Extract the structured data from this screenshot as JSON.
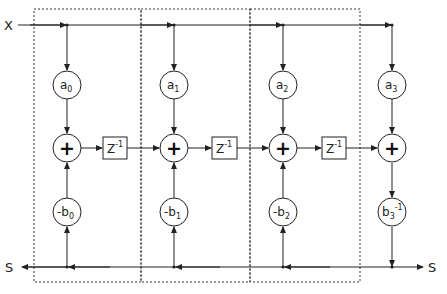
{
  "diagram": {
    "input_label": "X",
    "output_left_label": "S",
    "output_right_label": "S",
    "stages": [
      {
        "a": {
          "base": "a",
          "sub": "0"
        },
        "b": {
          "prefix": "-",
          "base": "b",
          "sub": "0",
          "sup": ""
        },
        "sum": "+",
        "delay": {
          "base": "Z",
          "sup": "-1"
        }
      },
      {
        "a": {
          "base": "a",
          "sub": "1"
        },
        "b": {
          "prefix": "-",
          "base": "b",
          "sub": "1",
          "sup": ""
        },
        "sum": "+",
        "delay": {
          "base": "Z",
          "sup": "-1"
        }
      },
      {
        "a": {
          "base": "a",
          "sub": "2"
        },
        "b": {
          "prefix": "-",
          "base": "b",
          "sub": "2",
          "sup": ""
        },
        "sum": "+",
        "delay": {
          "base": "Z",
          "sup": "-1"
        }
      },
      {
        "a": {
          "base": "a",
          "sub": "3"
        },
        "b": {
          "prefix": "",
          "base": "b",
          "sub": "3",
          "sup": "-1"
        },
        "sum": "+"
      }
    ],
    "colors": {
      "line": "#222222",
      "dashed": "#333333",
      "background": "#ffffff"
    }
  }
}
